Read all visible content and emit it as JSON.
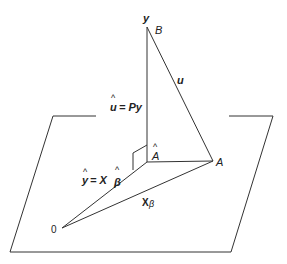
{
  "diagram": {
    "labels": {
      "y": "y",
      "B": "B",
      "u": "u",
      "u_hat_eq_Py": "= Py",
      "u_hat_sym": "u",
      "A_hat": "A",
      "A": "A",
      "y_hat_eq": "= X",
      "y_hat_sym": "y",
      "beta_hat": "β",
      "X_beta": "X",
      "beta": "β",
      "origin": "0"
    },
    "colors": {
      "line": "#333333",
      "text": "#222222",
      "background": "#ffffff"
    }
  }
}
